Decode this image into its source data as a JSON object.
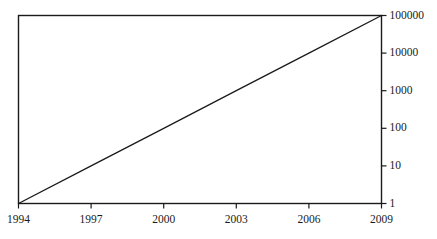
{
  "chart_data": {
    "type": "line",
    "title": "",
    "subtitle": "",
    "xlabel": "",
    "ylabel": "",
    "yscale": "log",
    "xscale": "linear",
    "grid": false,
    "legend": null,
    "xlim": [
      1994,
      2009
    ],
    "ylim": [
      1,
      100000
    ],
    "x_ticks": [
      {
        "value": 1994,
        "label": "1994"
      },
      {
        "value": 1997,
        "label": "1997"
      },
      {
        "value": 2000,
        "label": "2000"
      },
      {
        "value": 2003,
        "label": "2003"
      },
      {
        "value": 2006,
        "label": "2006"
      },
      {
        "value": 2009,
        "label": "2009"
      }
    ],
    "y_ticks": [
      {
        "value": 1,
        "label": "1"
      },
      {
        "value": 10,
        "label": "10"
      },
      {
        "value": 100,
        "label": "100"
      },
      {
        "value": 1000,
        "label": "1000"
      },
      {
        "value": 10000,
        "label": "10000"
      },
      {
        "value": 100000,
        "label": "100000"
      }
    ],
    "y_axis_position": "right",
    "series": [
      {
        "name": "",
        "color": "#1a1a1a",
        "x": [
          1994,
          1997,
          2000,
          2003,
          2006,
          2009
        ],
        "values": [
          1,
          10,
          100,
          1000,
          10000,
          100000
        ]
      }
    ]
  },
  "style": {
    "background": "#ffffff",
    "axis_color": "#1a1a1a",
    "line_color": "#1a1a1a"
  }
}
